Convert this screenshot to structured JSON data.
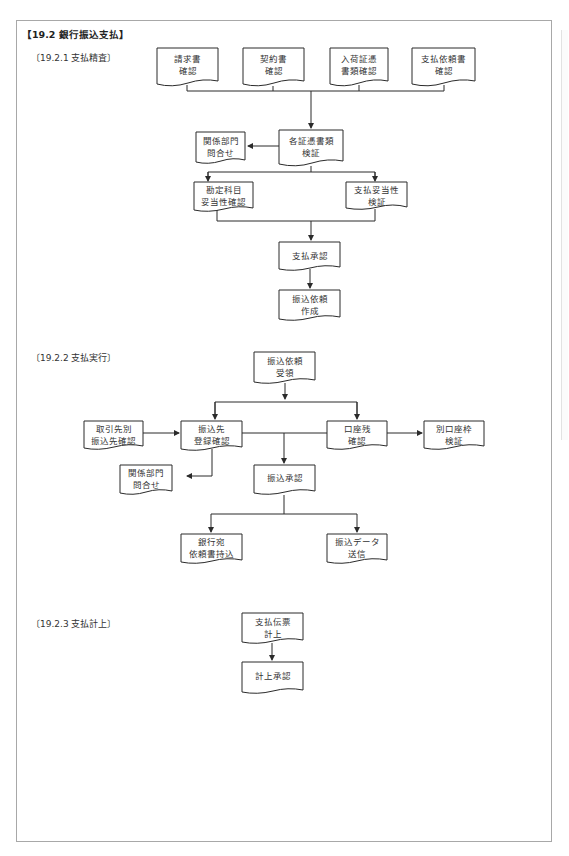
{
  "document": {
    "title": "【19.2  銀行振込支払】",
    "sections": [
      {
        "id": "19.2.1",
        "heading": "〔19.2.1  支払精査〕"
      },
      {
        "id": "19.2.2",
        "heading": "〔19.2.2  支払実行〕"
      },
      {
        "id": "19.2.3",
        "heading": "〔19.2.3  支払計上〕"
      }
    ]
  },
  "flow_19_2_1": {
    "boxes": [
      {
        "key": "invoice",
        "label": "請求書\n確認"
      },
      {
        "key": "contract",
        "label": "契約書\n確認"
      },
      {
        "key": "receipt",
        "label": "入荷証憑\n書類確認"
      },
      {
        "key": "request",
        "label": "支払依頼書\n確認"
      },
      {
        "key": "crosscheck",
        "label": "各証憑書類\n検証"
      },
      {
        "key": "inquiry",
        "label": "関係部門\n問合せ"
      },
      {
        "key": "account",
        "label": "勘定科目\n妥当性確認"
      },
      {
        "key": "validity",
        "label": "支払妥当性\n検証"
      },
      {
        "key": "approval",
        "label": "支払承認"
      },
      {
        "key": "transfer_request",
        "label": "振込依頼\n作成"
      }
    ]
  },
  "flow_19_2_2": {
    "boxes": [
      {
        "key": "receive",
        "label": "振込依頼\n受領"
      },
      {
        "key": "vendor",
        "label": "取引先別\n振込先確認"
      },
      {
        "key": "payee",
        "label": "振込先\n登録確認"
      },
      {
        "key": "balance",
        "label": "口座残\n確認"
      },
      {
        "key": "other_account",
        "label": "別口座枠\n検証"
      },
      {
        "key": "inquiry2",
        "label": "関係部門\n問合せ"
      },
      {
        "key": "transfer_approval",
        "label": "振込承認"
      },
      {
        "key": "bank_doc",
        "label": "銀行宛\n依頼書持込"
      },
      {
        "key": "send_data",
        "label": "振込データ\n送信"
      }
    ]
  },
  "flow_19_2_3": {
    "boxes": [
      {
        "key": "slip",
        "label": "支払伝票\n計上"
      },
      {
        "key": "post_approval",
        "label": "計上承認"
      }
    ]
  },
  "colors": {
    "line": "#2b2b2b",
    "frame": "#a8a8a8",
    "text": "#333333"
  }
}
